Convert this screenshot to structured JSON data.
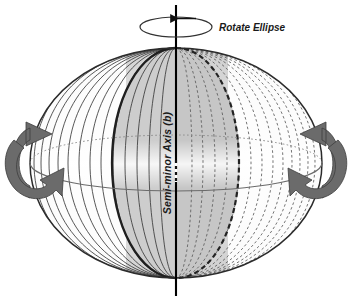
{
  "figure": {
    "background_color": "#ffffff",
    "title_visible": false,
    "labels": {
      "rotate_ellipse": "Rotate Ellipse",
      "semi_minor_axis": "Semi-minor Axis (b)"
    },
    "caption_partial": "",
    "colors": {
      "body_fill": "#c9c9c9",
      "body_fill_light": "#e8e8e8",
      "body_fill_highlight": "#f2f2f2",
      "outline": "#2b2b2b",
      "meridian_front": "#3a3a3a",
      "meridian_back": "#5a5a5a",
      "axis_line": "#000000",
      "arrow_fill": "#6b6b6b",
      "arrow_stroke": "#3a3a3a",
      "text": "#1a1a1a"
    },
    "geometry": {
      "center_x": 176,
      "center_y": 163,
      "semi_major_a": 146,
      "semi_minor_b": 115,
      "axis_top_y": 5,
      "axis_bottom_y": 296,
      "meridian_count_front": 14,
      "meridian_count_back": 13
    },
    "elements": {
      "rotation_indicator_ellipse": "rotation-arc",
      "rotation_arrowhead": "arrow-left",
      "left_rotation_arrow": "curved-arrow-right",
      "right_rotation_arrow": "curved-arrow-left",
      "equator_front_style": "solid",
      "equator_back_style": "dotted",
      "meridian_front_style": "solid",
      "meridian_back_style": "dashed",
      "axis_style": "solid-vertical",
      "axis_center_marker_style": "dashed-short"
    }
  }
}
